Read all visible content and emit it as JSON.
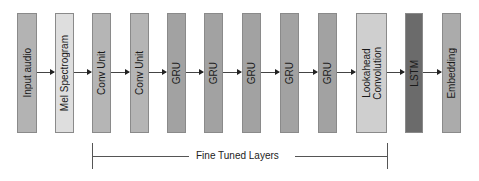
{
  "diagram": {
    "type": "pipeline",
    "direction": "left-to-right",
    "nodes": [
      {
        "id": "input-audio",
        "label": "Input audio",
        "color": "#b3b3b3",
        "x": 17,
        "w": 20
      },
      {
        "id": "mel-spectrogram",
        "label": "Mel Spectrogram",
        "color": "#dedede",
        "x": 55,
        "w": 19
      },
      {
        "id": "conv-unit-1",
        "label": "Conv Unit",
        "color": "#b5b5b5",
        "x": 92,
        "w": 19
      },
      {
        "id": "conv-unit-2",
        "label": "Conv Unit",
        "color": "#b5b5b5",
        "x": 130,
        "w": 19
      },
      {
        "id": "gru-1",
        "label": "GRU",
        "color": "#a2a2a2",
        "x": 167,
        "w": 19
      },
      {
        "id": "gru-2",
        "label": "GRU",
        "color": "#a2a2a2",
        "x": 204,
        "w": 19
      },
      {
        "id": "gru-3",
        "label": "GRU",
        "color": "#a2a2a2",
        "x": 242,
        "w": 19
      },
      {
        "id": "gru-4",
        "label": "GRU",
        "color": "#a2a2a2",
        "x": 280,
        "w": 19
      },
      {
        "id": "gru-5",
        "label": "GRU",
        "color": "#a2a2a2",
        "x": 318,
        "w": 19
      },
      {
        "id": "lookahead-convolution",
        "label": "Lookahead\nConvolution",
        "color": "#cfcfcf",
        "x": 356,
        "w": 31
      },
      {
        "id": "lstm",
        "label": "LSTM",
        "color": "#6b6b6b",
        "x": 405,
        "w": 18
      },
      {
        "id": "embedding",
        "label": "Embedding",
        "color": "#ababab",
        "x": 442,
        "w": 19
      }
    ],
    "edges": [
      [
        "input-audio",
        "mel-spectrogram"
      ],
      [
        "mel-spectrogram",
        "conv-unit-1"
      ],
      [
        "conv-unit-1",
        "conv-unit-2"
      ],
      [
        "conv-unit-2",
        "gru-1"
      ],
      [
        "gru-1",
        "gru-2"
      ],
      [
        "gru-2",
        "gru-3"
      ],
      [
        "gru-3",
        "gru-4"
      ],
      [
        "gru-4",
        "gru-5"
      ],
      [
        "gru-5",
        "lookahead-convolution"
      ],
      [
        "lookahead-convolution",
        "lstm"
      ],
      [
        "lstm",
        "embedding"
      ]
    ],
    "bracket": {
      "label": "Fine Tuned Layers",
      "from": "conv-unit-1",
      "to": "lookahead-convolution"
    }
  }
}
